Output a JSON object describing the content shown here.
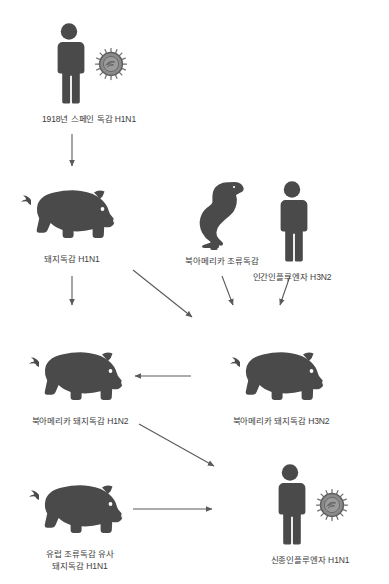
{
  "diagram": {
    "title_caption": "",
    "colors": {
      "silhouette": "#4a4a4a",
      "virus": "#7d7d7d",
      "arrow": "#5a5a5a",
      "label_text": "#3d3d3d",
      "background": "#ffffff"
    },
    "nodes": [
      {
        "id": "spanish-flu-1918",
        "label": "1918년 스페인 독감 H1N1",
        "label_line2": "",
        "icons": [
          "human-icon",
          "virus-icon"
        ]
      },
      {
        "id": "swine-flu-h1n1",
        "label": "돼지독감 H1N1",
        "label_line2": "",
        "icons": [
          "pig-icon"
        ]
      },
      {
        "id": "north-american-avian-flu",
        "label": "북아메리카 조류독감",
        "label_line2": "",
        "icons": [
          "duck-icon"
        ]
      },
      {
        "id": "human-influenza-h3n2",
        "label": "인간인플루엔자 H3N2",
        "label_line2": "",
        "icons": [
          "human-icon"
        ]
      },
      {
        "id": "north-american-swine-h1n2",
        "label": "북아메리카 돼지독감 H1N2",
        "label_line2": "",
        "icons": [
          "pig-icon"
        ]
      },
      {
        "id": "north-american-swine-h3n2",
        "label": "북아메리카 돼지독감 H3N2",
        "label_line2": "",
        "icons": [
          "pig-icon"
        ]
      },
      {
        "id": "european-avian-like-swine-h1n1",
        "label": "유럽 조류독감 유사",
        "label_line2": "돼지독감 H1N1",
        "icons": [
          "pig-icon"
        ]
      },
      {
        "id": "novel-influenza-h1n1",
        "label": "신종인플루엔자 H1N1",
        "label_line2": "",
        "icons": [
          "human-icon",
          "virus-icon"
        ]
      }
    ],
    "edges": [
      {
        "id": "edge-spanish-to-swine",
        "from": "spanish-flu-1918",
        "to": "swine-flu-h1n1"
      },
      {
        "id": "edge-swine-to-h1n2",
        "from": "swine-flu-h1n1",
        "to": "north-american-swine-h1n2"
      },
      {
        "id": "edge-swine-to-mix",
        "from": "swine-flu-h1n1",
        "to": "north-american-swine-h3n2"
      },
      {
        "id": "edge-avian-to-mix",
        "from": "north-american-avian-flu",
        "to": "north-american-swine-h3n2"
      },
      {
        "id": "edge-human-to-mix",
        "from": "human-influenza-h3n2",
        "to": "north-american-swine-h3n2"
      },
      {
        "id": "edge-h3n2-to-h1n2",
        "from": "north-american-swine-h3n2",
        "to": "north-american-swine-h1n2"
      },
      {
        "id": "edge-h1n2-to-novel",
        "from": "north-american-swine-h1n2",
        "to": "novel-influenza-h1n1"
      },
      {
        "id": "edge-european-to-novel",
        "from": "european-avian-like-swine-h1n1",
        "to": "novel-influenza-h1n1"
      }
    ]
  }
}
